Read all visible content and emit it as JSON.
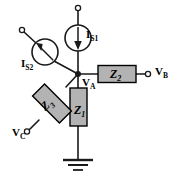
{
  "diagram": {
    "type": "electrical-schematic",
    "colors": {
      "wire": "#1a1a1a",
      "component_fill": "#b3b3b3",
      "component_stroke": "#000000",
      "background": "#ffffff",
      "label": "#000000"
    }
  },
  "labels": {
    "is1": "I",
    "is1_sub": "S1",
    "is2": "I",
    "is2_sub": "S2",
    "va": "V",
    "va_sub": "A",
    "vb": "V",
    "vb_sub": "B",
    "vc": "V",
    "vc_sub": "C",
    "z1": "Z",
    "z1_sub": "1",
    "z2": "Z",
    "z2_sub": "2",
    "z3": "Z",
    "z3_sub": "3"
  },
  "components": [
    {
      "name": "current-source-is1",
      "kind": "current-source",
      "label": "I_S1",
      "orientation": "vertical",
      "arrow_direction": "down",
      "cx": 78,
      "cy": 38,
      "r": 13
    },
    {
      "name": "current-source-is2",
      "kind": "current-source",
      "label": "I_S2",
      "orientation": "diagonal-45",
      "arrow_direction": "up-left",
      "cx": 45,
      "cy": 52,
      "r": 13
    },
    {
      "name": "impedance-z1",
      "kind": "impedance",
      "label": "Z_1",
      "orientation": "vertical",
      "x": 70,
      "y": 88,
      "w": 17,
      "h": 38
    },
    {
      "name": "impedance-z2",
      "kind": "impedance",
      "label": "Z_2",
      "orientation": "horizontal",
      "x": 98,
      "y": 65,
      "w": 38,
      "h": 17
    },
    {
      "name": "impedance-z3",
      "kind": "impedance",
      "label": "Z_3",
      "orientation": "diagonal-45",
      "cx": 52,
      "cy": 108,
      "w": 38,
      "h": 17
    }
  ],
  "nodes": [
    {
      "name": "node-a",
      "label": "V_A",
      "x": 78,
      "y": 74,
      "type": "junction-dot"
    },
    {
      "name": "terminal-is1-top",
      "x": 78,
      "y": 8,
      "type": "open-terminal"
    },
    {
      "name": "terminal-is2-top",
      "x": 22,
      "y": 30,
      "type": "open-terminal"
    },
    {
      "name": "terminal-vb",
      "label": "V_B",
      "x": 148,
      "y": 74,
      "type": "open-terminal"
    },
    {
      "name": "terminal-vc",
      "label": "V_C",
      "x": 27,
      "y": 131,
      "type": "open-terminal"
    },
    {
      "name": "ground",
      "x": 78,
      "y": 160,
      "type": "ground-symbol"
    }
  ]
}
